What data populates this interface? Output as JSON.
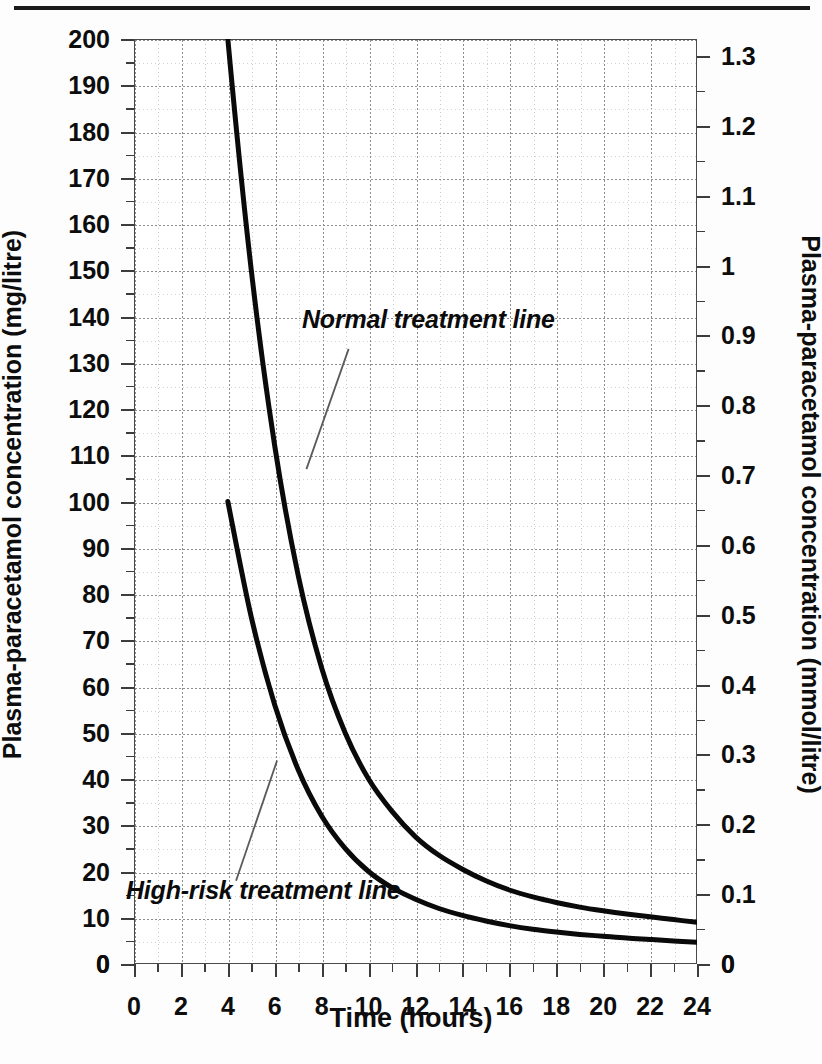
{
  "page": {
    "background": "#fdfdfd",
    "top_rule_color": "#1a1a1a"
  },
  "chart_data": {
    "type": "line",
    "title": "",
    "xlabel": "Time (hours)",
    "ylabel": "Plasma-paracetamol concentration (mg/litre)",
    "y2label": "Plasma-paracetamol concentration (mmol/litre)",
    "xlim": [
      0,
      24
    ],
    "ylim": [
      0,
      200
    ],
    "y2lim": [
      0,
      1.3245
    ],
    "grid": true,
    "legend_position": "inline-annotations",
    "xticks": [
      0,
      2,
      4,
      6,
      8,
      10,
      12,
      14,
      16,
      18,
      20,
      22,
      24
    ],
    "xticklabels": [
      "0",
      "2",
      "4",
      "6",
      "8",
      "10",
      "12",
      "14",
      "16",
      "18",
      "20",
      "22",
      "24"
    ],
    "x_minor_step": 1,
    "yticks": [
      0,
      10,
      20,
      30,
      40,
      50,
      60,
      70,
      80,
      90,
      100,
      110,
      120,
      130,
      140,
      150,
      160,
      170,
      180,
      190,
      200
    ],
    "yticklabels": [
      "0",
      "10",
      "20",
      "30",
      "40",
      "50",
      "60",
      "70",
      "80",
      "90",
      "100",
      "110",
      "120",
      "130",
      "140",
      "150",
      "160",
      "170",
      "180",
      "190",
      "200"
    ],
    "y2ticks": [
      0,
      0.1,
      0.2,
      0.3,
      0.4,
      0.5,
      0.6,
      0.7,
      0.8,
      0.9,
      1.0,
      1.1,
      1.2,
      1.3
    ],
    "y2ticklabels": [
      "0",
      "0.1",
      "0.2",
      "0.3",
      "0.4",
      "0.5",
      "0.6",
      "0.7",
      "0.8",
      "0.9",
      "1",
      "1.1",
      "1.2",
      "1.3"
    ],
    "series": [
      {
        "name": "Normal treatment line",
        "color": "#0a0a0a",
        "linewidth": 5,
        "x": [
          3.55,
          4,
          5,
          6,
          7,
          8,
          9,
          10,
          11,
          12,
          13,
          14,
          15,
          16,
          17,
          18,
          19,
          20,
          21,
          22,
          23,
          24
        ],
        "y": [
          230,
          200,
          150,
          112,
          84,
          64,
          50,
          40,
          33,
          27.5,
          23.5,
          20.5,
          18,
          16,
          14.5,
          13.3,
          12.3,
          11.5,
          10.8,
          10.2,
          9.6,
          9.0
        ]
      },
      {
        "name": "High-risk treatment line",
        "color": "#0a0a0a",
        "linewidth": 5,
        "x": [
          4,
          5,
          6,
          7,
          8,
          9,
          10,
          11,
          12,
          13,
          14,
          15,
          16,
          17,
          18,
          19,
          20,
          21,
          22,
          23,
          24
        ],
        "y": [
          100,
          75,
          56,
          42,
          32,
          25,
          20,
          16.5,
          14,
          12,
          10.5,
          9.3,
          8.3,
          7.5,
          6.9,
          6.4,
          6.0,
          5.6,
          5.3,
          5.0,
          4.7
        ]
      }
    ],
    "annotations": [
      {
        "text": "Normal treatment line",
        "style": "bold-italic",
        "leader": {
          "from_x": 9.15,
          "from_y": 133,
          "to_x": 7.35,
          "to_y": 107
        }
      },
      {
        "text": "High-risk treatment line",
        "style": "bold-italic",
        "leader": {
          "from_x": 4.35,
          "from_y": 18,
          "to_x": 6.1,
          "to_y": 44
        }
      }
    ]
  }
}
